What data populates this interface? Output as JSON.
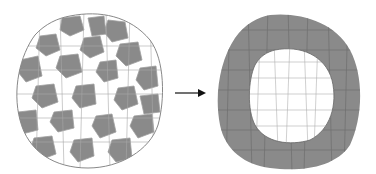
{
  "diagram": {
    "type": "cell-sorting",
    "panels": [
      {
        "id": "before",
        "label": "",
        "description": "Mixed aggregate of grey and white cells"
      },
      {
        "id": "after",
        "label": "",
        "description": "Sorted aggregate: grey cells outer shell, white cells inner core"
      }
    ],
    "arrow": {
      "from": "before",
      "to": "after",
      "direction": "right"
    },
    "colors": {
      "grey_cell": "#8a8a8a",
      "white_cell": "#ffffff",
      "cell_border": "#9a9a9a",
      "outline": "#888888",
      "arrow": "#111111"
    }
  }
}
